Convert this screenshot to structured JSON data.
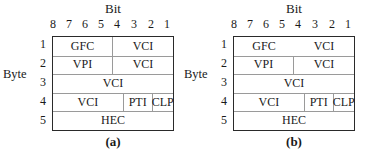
{
  "figure": {
    "panels": [
      {
        "id": "a",
        "caption": "(a)",
        "bit_title": "Bit",
        "bit_numbers": [
          "8",
          "7",
          "6",
          "5",
          "4",
          "3",
          "2",
          "1"
        ],
        "byte_label": "Byte",
        "byte_numbers": [
          "1",
          "2",
          "3",
          "4",
          "5"
        ],
        "rows": [
          {
            "cells": [
              {
                "label": "GFC",
                "bits": 4
              },
              {
                "label": "VCI",
                "bits": 4
              }
            ],
            "row1_divider": true
          },
          {
            "cells": [
              {
                "label": "VPI",
                "bits": 4
              },
              {
                "label": "VCI",
                "bits": 4
              }
            ]
          },
          {
            "cells": [
              {
                "label": "VCI",
                "bits": 8
              }
            ]
          },
          {
            "cells": [
              {
                "label": "VCI",
                "bits": 4
              },
              {
                "label": "PTI",
                "bits": 2.5
              },
              {
                "label": "CLP",
                "bits": 1.5
              }
            ]
          },
          {
            "cells": [
              {
                "label": "HEC",
                "bits": 8
              }
            ]
          }
        ]
      },
      {
        "id": "b",
        "caption": "(b)",
        "bit_title": "Bit",
        "bit_numbers": [
          "8",
          "7",
          "6",
          "5",
          "4",
          "3",
          "2",
          "1"
        ],
        "byte_label": "Byte",
        "byte_numbers": [
          "1",
          "2",
          "3",
          "4",
          "5"
        ],
        "rows": [
          {
            "cells": [
              {
                "label": "GFC",
                "bits": 4
              },
              {
                "label": "VCI",
                "bits": 4
              }
            ],
            "row1_divider": false
          },
          {
            "cells": [
              {
                "label": "VPI",
                "bits": 4
              },
              {
                "label": "VCI",
                "bits": 4
              }
            ]
          },
          {
            "cells": [
              {
                "label": "VCI",
                "bits": 8
              }
            ]
          },
          {
            "cells": [
              {
                "label": "VCI",
                "bits": 4
              },
              {
                "label": "PTI",
                "bits": 2.5
              },
              {
                "label": "CLP",
                "bits": 1.5
              }
            ]
          },
          {
            "cells": [
              {
                "label": "HEC",
                "bits": 8
              }
            ]
          }
        ]
      }
    ]
  }
}
